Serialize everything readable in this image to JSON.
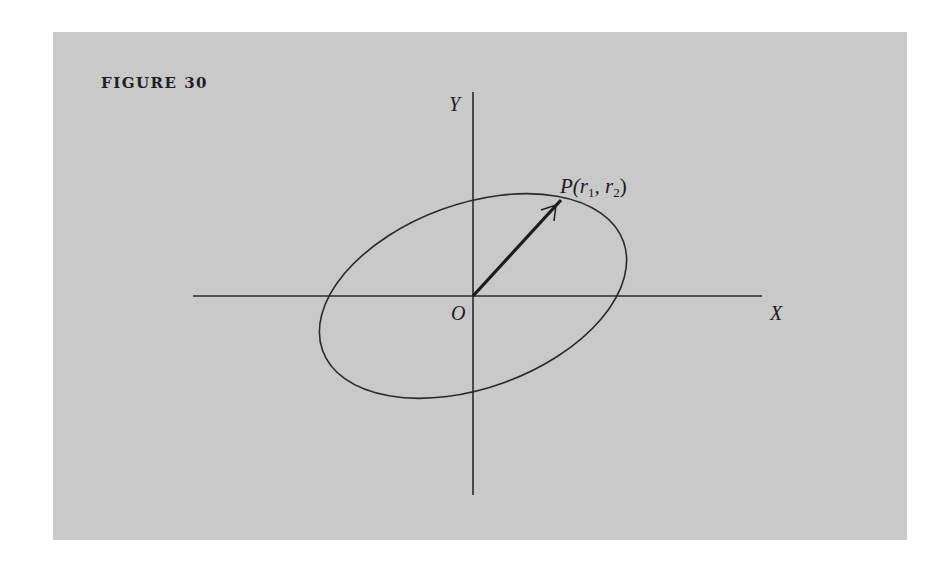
{
  "figure": {
    "label": "FIGURE 30",
    "background_color": "#c9c9c9",
    "line_color": "#2a2a2a"
  },
  "axes": {
    "x_label": "X",
    "y_label": "Y",
    "origin_label": "O"
  },
  "point": {
    "label_main": "P(r",
    "sub1": "1",
    "sep": ", r",
    "sub2": "2",
    "close": ")"
  },
  "ellipse": {
    "center": [
      473,
      296
    ],
    "rx": 160,
    "ry": 92,
    "rotation_deg": -20
  }
}
